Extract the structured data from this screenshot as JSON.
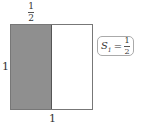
{
  "diagram": {
    "type": "unit-square-area",
    "square": {
      "width_label": "1",
      "height_label": "1"
    },
    "shaded_region": {
      "fraction_of_width": "1/2",
      "color": "#8f8f8f"
    },
    "top_label": {
      "numerator": "1",
      "denominator": "2"
    },
    "left_label": "1",
    "bottom_label": "1",
    "area_label": {
      "symbol": "S",
      "subscript": "1",
      "equals": "=",
      "numerator": "1",
      "denominator": "2"
    }
  }
}
